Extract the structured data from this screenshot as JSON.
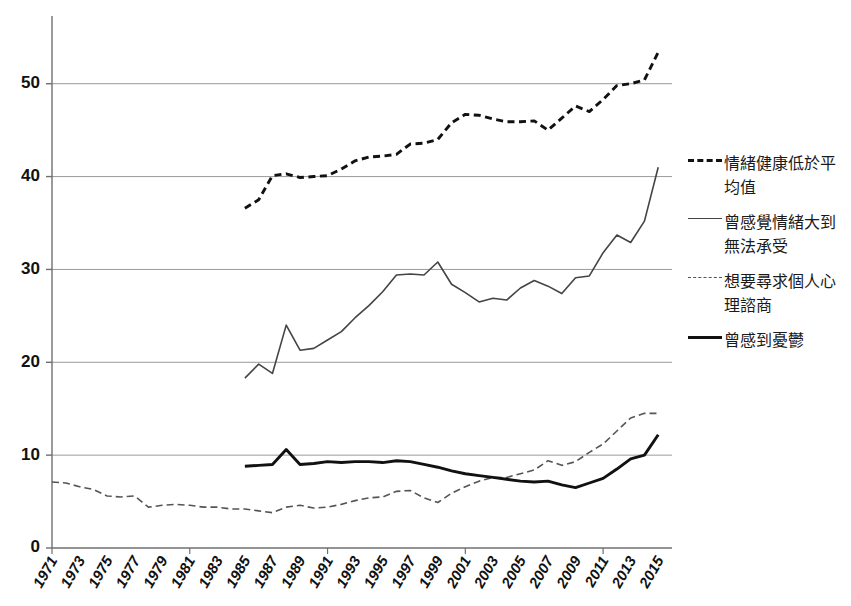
{
  "chart_data": {
    "type": "line",
    "title": "",
    "subtitle": "",
    "xlabel": "",
    "ylabel": "",
    "grid": true,
    "legend_position": "right",
    "xlim": [
      1971,
      2016
    ],
    "ylim": [
      0,
      56
    ],
    "y_ticks": [
      0,
      10,
      20,
      30,
      40,
      50
    ],
    "x_ticks": [
      "1971",
      "1973",
      "1975",
      "1977",
      "1979",
      "1981",
      "1983",
      "1985",
      "1987",
      "1989",
      "1991",
      "1993",
      "1995",
      "1997",
      "1999",
      "2001",
      "2003",
      "2005",
      "2007",
      "2009",
      "2011",
      "2013",
      "2015"
    ],
    "series": [
      {
        "name": "情緒健康低於平均值",
        "style": "dashed",
        "weight": "thick",
        "color": "#111111",
        "x": [
          1985,
          1986,
          1987,
          1988,
          1989,
          1990,
          1991,
          1992,
          1993,
          1994,
          1995,
          1996,
          1997,
          1998,
          1999,
          2000,
          2001,
          2002,
          2003,
          2004,
          2005,
          2006,
          2007,
          2008,
          2009,
          2010,
          2011,
          2012,
          2013,
          2014,
          2015
        ],
        "values": [
          36.6,
          37.5,
          40.1,
          40.3,
          39.9,
          40.0,
          40.1,
          40.8,
          41.7,
          42.1,
          42.2,
          42.4,
          43.5,
          43.6,
          44.0,
          45.8,
          46.7,
          46.6,
          46.2,
          45.9,
          45.9,
          46.0,
          45.0,
          46.3,
          47.6,
          47.0,
          48.3,
          49.8,
          50.0,
          50.4,
          53.4
        ]
      },
      {
        "name": "曾感覺情緒大到無法承受",
        "style": "solid",
        "weight": "thin",
        "color": "#444444",
        "x": [
          1985,
          1986,
          1987,
          1988,
          1989,
          1990,
          1991,
          1992,
          1993,
          1994,
          1995,
          1996,
          1997,
          1998,
          1999,
          2000,
          2001,
          2002,
          2003,
          2004,
          2005,
          2006,
          2007,
          2008,
          2009,
          2010,
          2011,
          2012,
          2013,
          2014,
          2015
        ],
        "values": [
          18.3,
          19.8,
          18.8,
          24.0,
          21.3,
          21.5,
          22.4,
          23.3,
          24.8,
          26.1,
          27.6,
          29.4,
          29.5,
          29.4,
          30.8,
          28.4,
          27.5,
          26.5,
          26.9,
          26.7,
          28.0,
          28.8,
          28.2,
          27.4,
          29.1,
          29.3,
          31.8,
          33.7,
          32.9,
          35.2,
          41.0
        ]
      },
      {
        "name": "想要尋求個人心理諮商",
        "style": "dashed",
        "weight": "thin",
        "color": "#555555",
        "x": [
          1971,
          1972,
          1973,
          1974,
          1975,
          1976,
          1977,
          1978,
          1979,
          1980,
          1981,
          1982,
          1983,
          1984,
          1985,
          1986,
          1987,
          1988,
          1989,
          1990,
          1991,
          1992,
          1993,
          1994,
          1995,
          1996,
          1997,
          1998,
          1999,
          2000,
          2001,
          2002,
          2003,
          2004,
          2005,
          2006,
          2007,
          2008,
          2009,
          2010,
          2011,
          2012,
          2013,
          2014,
          2015
        ],
        "values": [
          7.1,
          7.0,
          6.6,
          6.3,
          5.6,
          5.5,
          5.6,
          4.4,
          4.6,
          4.7,
          4.6,
          4.4,
          4.4,
          4.2,
          4.2,
          4.0,
          3.8,
          4.4,
          4.6,
          4.3,
          4.4,
          4.7,
          5.1,
          5.4,
          5.5,
          6.1,
          6.2,
          5.4,
          4.9,
          5.9,
          6.6,
          7.2,
          7.6,
          7.6,
          8.0,
          8.4,
          9.4,
          8.9,
          9.3,
          10.3,
          11.2,
          12.6,
          14.0,
          14.5,
          14.5
        ]
      },
      {
        "name": "曾感到憂鬱",
        "style": "solid",
        "weight": "thick",
        "color": "#111111",
        "x": [
          1985,
          1986,
          1987,
          1988,
          1989,
          1990,
          1991,
          1992,
          1993,
          1994,
          1995,
          1996,
          1997,
          1998,
          1999,
          2000,
          2001,
          2002,
          2003,
          2004,
          2005,
          2006,
          2007,
          2008,
          2009,
          2010,
          2011,
          2012,
          2013,
          2014,
          2015
        ],
        "values": [
          8.8,
          8.9,
          9.0,
          10.6,
          9.0,
          9.1,
          9.3,
          9.2,
          9.3,
          9.3,
          9.2,
          9.4,
          9.3,
          9.0,
          8.7,
          8.3,
          8.0,
          7.8,
          7.6,
          7.4,
          7.2,
          7.1,
          7.2,
          6.8,
          6.5,
          7.0,
          7.5,
          8.5,
          9.6,
          10.0,
          12.2
        ]
      }
    ]
  },
  "legend": {
    "entries": [
      {
        "label": "情緒健康低於平均值",
        "swatch": "dashed-thick"
      },
      {
        "label": "曾感覺情緒大到無法承受",
        "swatch": "solid-thin"
      },
      {
        "label": "想要尋求個人心理諮商",
        "swatch": "dashed-thin"
      },
      {
        "label": "曾感到憂鬱",
        "swatch": "solid-thick"
      }
    ]
  },
  "axes": {
    "y_tick_labels": [
      "0",
      "10",
      "20",
      "30",
      "40",
      "50"
    ],
    "x_tick_labels": [
      "1971",
      "1973",
      "1975",
      "1977",
      "1979",
      "1981",
      "1983",
      "1985",
      "1987",
      "1989",
      "1991",
      "1993",
      "1995",
      "1997",
      "1999",
      "2001",
      "2003",
      "2005",
      "2007",
      "2009",
      "2011",
      "2013",
      "2015"
    ]
  },
  "colors": {
    "gridline": "#9a9a9a",
    "axis": "#6f6f6f",
    "text": "#111111",
    "background": "#ffffff"
  }
}
